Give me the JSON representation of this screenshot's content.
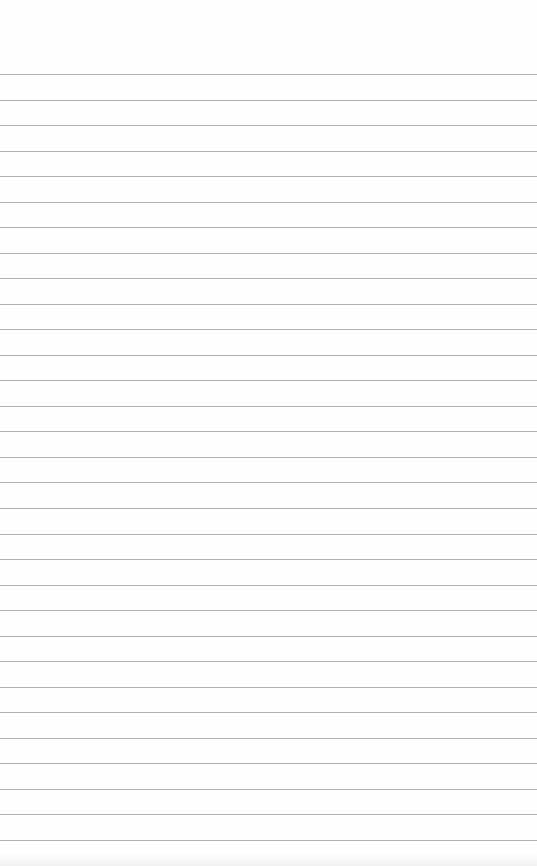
{
  "image": {
    "description": "Blank lined notebook paper",
    "background_color": "#fefefe",
    "rule_color": "#9a9a9a",
    "first_rule_y": 74,
    "rule_spacing": 25.53,
    "rule_count": 31
  }
}
